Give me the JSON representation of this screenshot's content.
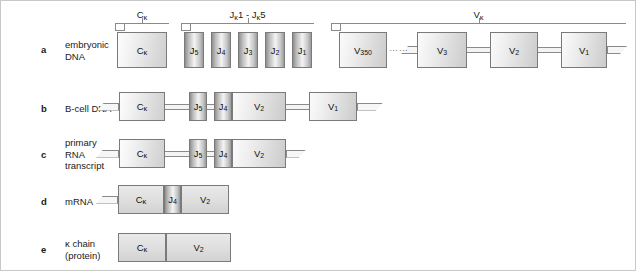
{
  "figure": {
    "brackets": [
      {
        "name": "bracket-ckappa",
        "label_main": "C",
        "label_kappa": "κ",
        "x": 114,
        "w": 54,
        "label_x": 114,
        "label_y": 8
      },
      {
        "name": "bracket-jkappa",
        "label_main": "J",
        "label_kappa": "κ",
        "label_rest": "1 - J",
        "label_kappa2": "κ",
        "label_rest2": "5",
        "x": 180,
        "w": 133,
        "label_x": 180,
        "label_y": 8
      },
      {
        "name": "bracket-vkappa",
        "label_main": "V",
        "label_kappa": "κ",
        "x": 330,
        "w": 295,
        "label_x": 330,
        "label_y": 8
      }
    ],
    "rows": [
      {
        "letter": "a",
        "label": "embryonic\nDNA",
        "letter_y": 43,
        "label_y": 38,
        "track_y": 31,
        "segments": [
          {
            "name": "segment-c-kappa",
            "kind": "c",
            "text": "C",
            "kappa": "κ",
            "x": 116,
            "w": 50,
            "h": 36
          },
          {
            "name": "segment-j5",
            "kind": "j",
            "text": "J",
            "sub": "5",
            "x": 183,
            "w": 20,
            "h": 36
          },
          {
            "name": "segment-j4",
            "kind": "j",
            "text": "J",
            "sub": "4",
            "x": 210,
            "w": 20,
            "h": 36
          },
          {
            "name": "segment-j3",
            "kind": "j",
            "text": "J",
            "sub": "3",
            "x": 237,
            "w": 20,
            "h": 36
          },
          {
            "name": "segment-j2",
            "kind": "j",
            "text": "J",
            "sub": "2",
            "x": 264,
            "w": 20,
            "h": 36
          },
          {
            "name": "segment-j1",
            "kind": "j",
            "text": "J",
            "sub": "1",
            "x": 291,
            "w": 20,
            "h": 36
          },
          {
            "name": "segment-v350",
            "kind": "v",
            "text": "V",
            "sub": "350",
            "x": 338,
            "w": 48,
            "h": 36
          },
          {
            "name": "segment-v3",
            "kind": "v",
            "text": "V",
            "sub": "3",
            "x": 416,
            "w": 50,
            "h": 36
          },
          {
            "name": "segment-v2",
            "kind": "v",
            "text": "V",
            "sub": "2",
            "x": 489,
            "w": 48,
            "h": 36
          },
          {
            "name": "segment-v1",
            "kind": "v",
            "text": "V",
            "sub": "1",
            "x": 560,
            "w": 46,
            "h": 36
          }
        ],
        "connectors": [
          {
            "name": "connector-v3-v2",
            "x": 466,
            "w": 23
          },
          {
            "name": "connector-v2-v1",
            "x": 537,
            "w": 23
          }
        ],
        "tails": [
          {
            "name": "tail-right-a",
            "side": "right",
            "x": 606,
            "w": 20
          }
        ],
        "dots": [
          {
            "name": "ellipsis-v-region",
            "text": "……",
            "x": 388,
            "y": 44
          }
        ],
        "stub": [
          {
            "name": "stub-left-v3",
            "side": "left",
            "x": 400,
            "w": 18
          }
        ]
      },
      {
        "letter": "b",
        "label": "B-cell DNA",
        "letter_y": 102,
        "label_y": 102,
        "track_y": 91,
        "segments": [
          {
            "name": "segment-c-kappa",
            "kind": "c",
            "text": "C",
            "kappa": "κ",
            "x": 118,
            "w": 46,
            "h": 29
          },
          {
            "name": "segment-j5",
            "kind": "j",
            "text": "J",
            "sub": "5",
            "x": 188,
            "w": 18,
            "h": 29
          },
          {
            "name": "segment-j4",
            "kind": "j",
            "text": "J",
            "sub": "4",
            "x": 213,
            "w": 18,
            "h": 29
          },
          {
            "name": "segment-v2",
            "kind": "v",
            "text": "V",
            "sub": "2",
            "x": 231,
            "w": 54,
            "h": 29
          },
          {
            "name": "segment-v1",
            "kind": "v",
            "text": "V",
            "sub": "1",
            "x": 308,
            "w": 48,
            "h": 29
          }
        ],
        "connectors": [
          {
            "name": "connector-c-j5",
            "x": 164,
            "w": 24
          },
          {
            "name": "connector-j5-j4",
            "x": 206,
            "w": 7
          },
          {
            "name": "connector-v2-v1",
            "x": 285,
            "w": 23
          }
        ],
        "tails": [
          {
            "name": "tail-left-b",
            "side": "left",
            "x": 96,
            "w": 22
          },
          {
            "name": "tail-right-b",
            "side": "right",
            "x": 356,
            "w": 26
          }
        ]
      },
      {
        "letter": "c",
        "label": "primary\nRNA\ntranscript",
        "letter_y": 148,
        "label_y": 136,
        "track_y": 138,
        "segments": [
          {
            "name": "segment-c-kappa",
            "kind": "c",
            "text": "C",
            "kappa": "κ",
            "x": 118,
            "w": 46,
            "h": 29
          },
          {
            "name": "segment-j5",
            "kind": "j",
            "text": "J",
            "sub": "5",
            "x": 188,
            "w": 18,
            "h": 29
          },
          {
            "name": "segment-j4",
            "kind": "j",
            "text": "J",
            "sub": "4",
            "x": 213,
            "w": 18,
            "h": 29
          },
          {
            "name": "segment-v2",
            "kind": "v",
            "text": "V",
            "sub": "2",
            "x": 231,
            "w": 54,
            "h": 29
          }
        ],
        "connectors": [
          {
            "name": "connector-c-j5",
            "x": 164,
            "w": 24
          },
          {
            "name": "connector-j5-j4",
            "x": 206,
            "w": 7
          }
        ],
        "tails": [
          {
            "name": "tail-left-c",
            "side": "left",
            "x": 95,
            "w": 23
          },
          {
            "name": "tail-right-c",
            "side": "right",
            "x": 285,
            "w": 20
          }
        ]
      },
      {
        "letter": "d",
        "label": "mRNA",
        "letter_y": 195,
        "label_y": 195,
        "track_y": 184,
        "segments": [
          {
            "name": "segment-c-kappa",
            "kind": "flat",
            "text": "C",
            "kappa": "κ",
            "x": 117,
            "w": 46,
            "h": 29
          },
          {
            "name": "segment-j4",
            "kind": "j",
            "text": "J",
            "sub": "4",
            "x": 163,
            "w": 17,
            "h": 29
          },
          {
            "name": "segment-v2",
            "kind": "flat",
            "text": "V",
            "sub": "2",
            "x": 180,
            "w": 48,
            "h": 29
          }
        ],
        "connectors": [],
        "tails": [
          {
            "name": "tail-left-d",
            "side": "left",
            "x": 95,
            "w": 22
          }
        ]
      },
      {
        "letter": "e",
        "label": "κ chain\n(protein)",
        "letter_y": 243,
        "label_y": 237,
        "track_y": 232,
        "segments": [
          {
            "name": "segment-c-kappa",
            "kind": "flat",
            "text": "C",
            "kappa": "κ",
            "x": 117,
            "w": 48,
            "h": 29
          },
          {
            "name": "segment-v2",
            "kind": "flat",
            "text": "V",
            "sub": "2",
            "x": 165,
            "w": 65,
            "h": 29
          }
        ],
        "connectors": [],
        "tails": []
      }
    ]
  }
}
